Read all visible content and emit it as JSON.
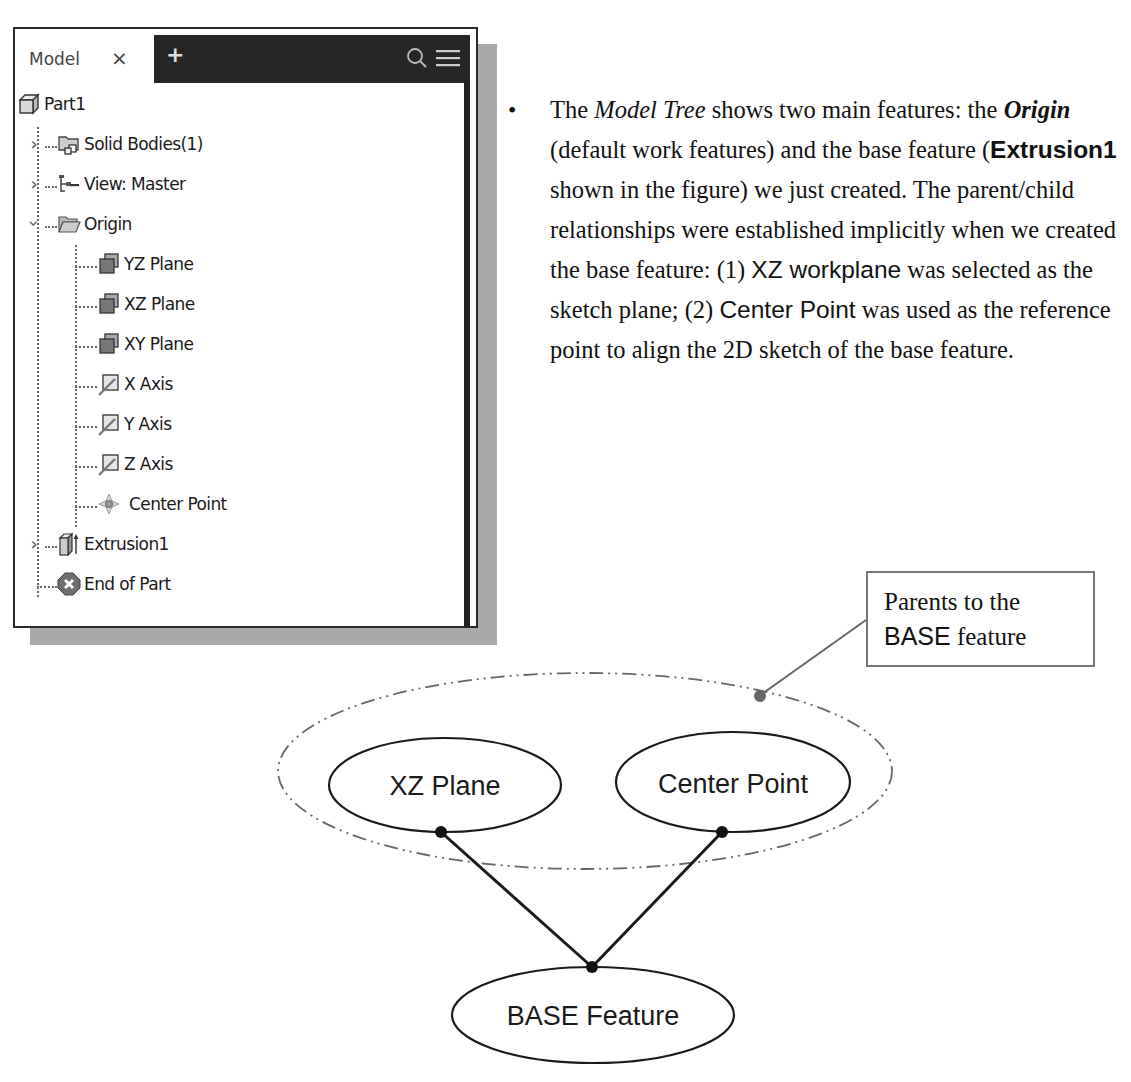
{
  "model_browser": {
    "tab_label": "Model",
    "close_glyph": "×",
    "add_glyph": "+",
    "search_icon": "search-icon",
    "menu_icon": "hamburger-menu-icon",
    "tree": [
      {
        "label": "Part1",
        "icon": "part-icon",
        "level": 0,
        "expander": ""
      },
      {
        "label": "Solid Bodies(1)",
        "icon": "solid-bodies-icon",
        "level": 1,
        "expander": "collapsed"
      },
      {
        "label": "View: Master",
        "icon": "view-rep-icon",
        "level": 1,
        "expander": "collapsed"
      },
      {
        "label": "Origin",
        "icon": "open-folder-icon",
        "level": 1,
        "expander": "expanded"
      },
      {
        "label": "YZ Plane",
        "icon": "work-plane-icon",
        "level": 2,
        "expander": ""
      },
      {
        "label": "XZ Plane",
        "icon": "work-plane-icon",
        "level": 2,
        "expander": ""
      },
      {
        "label": "XY Plane",
        "icon": "work-plane-icon",
        "level": 2,
        "expander": ""
      },
      {
        "label": "X Axis",
        "icon": "work-axis-icon",
        "level": 2,
        "expander": ""
      },
      {
        "label": "Y Axis",
        "icon": "work-axis-icon",
        "level": 2,
        "expander": ""
      },
      {
        "label": "Z Axis",
        "icon": "work-axis-icon",
        "level": 2,
        "expander": ""
      },
      {
        "label": "Center Point",
        "icon": "work-point-icon",
        "level": 2,
        "expander": ""
      },
      {
        "label": "Extrusion1",
        "icon": "extrusion-icon",
        "level": 1,
        "expander": "collapsed"
      },
      {
        "label": "End of Part",
        "icon": "end-of-part-icon",
        "level": 1,
        "expander": ""
      }
    ]
  },
  "bullet": {
    "t1": "The ",
    "t2_italic": "Model Tree",
    "t3": " shows two main features: the ",
    "t4_bolditalic": "Origin",
    "t5": " (default work features) and the base feature (",
    "t6_sansbold": "Extrusion1",
    "t7": " shown in the figure) we just created. The parent/child relationships were established implicitly when we created the base feature: (1) ",
    "t8_sans": "XZ workplane",
    "t9": " was selected as the sketch plane; (2) ",
    "t10_sans": "Center Point",
    "t11": " was used as the reference point to align the 2D sketch of the base feature."
  },
  "diagram": {
    "callout_line1": "Parents to the",
    "callout_line2_sans": "BASE",
    "callout_line2_rest": " feature",
    "nodes": {
      "xz_plane": "XZ Plane",
      "center_point": "Center Point",
      "base_feature": "BASE Feature"
    }
  }
}
